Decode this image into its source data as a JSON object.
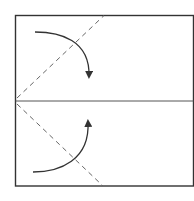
{
  "diagram": {
    "type": "origami-fold-instructions",
    "paper": {
      "x": 15,
      "y": 15,
      "width": 180,
      "height": 171,
      "stroke": "#333333"
    },
    "center_crease": {
      "y": 101,
      "style": "solid",
      "stroke": "#555555"
    },
    "valley_folds": [
      {
        "name": "upper-left-fold",
        "from": [
          15,
          98
        ],
        "to": [
          104,
          15
        ],
        "style": "dashed"
      },
      {
        "name": "lower-left-fold",
        "from": [
          15,
          104
        ],
        "to": [
          103,
          186
        ],
        "style": "dashed"
      }
    ],
    "arrows": [
      {
        "name": "fold-down-arrow",
        "direction": "down",
        "start": [
          35,
          32
        ],
        "tip": [
          88,
          80
        ]
      },
      {
        "name": "fold-up-arrow",
        "direction": "up",
        "start": [
          33,
          172
        ],
        "tip": [
          87,
          118
        ]
      }
    ],
    "colors": {
      "line": "#333333",
      "dash": "#666666",
      "background": "#ffffff"
    }
  }
}
